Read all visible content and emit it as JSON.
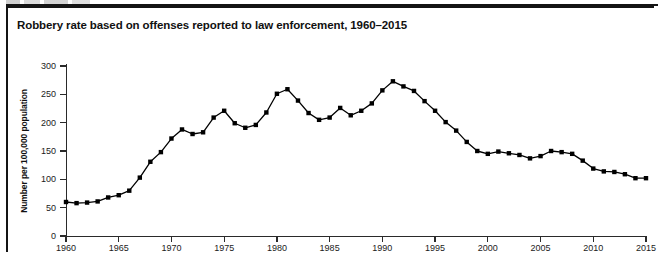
{
  "figure": {
    "title": "Robbery rate based on offenses reported to law enforcement, 1960–2015",
    "frame_color": "#141414",
    "background": "#ffffff"
  },
  "chart_data": {
    "type": "line",
    "title": "Robbery rate based on offenses reported to law enforcement, 1960–2015",
    "xlabel": "",
    "ylabel": "Number per 100,000 population",
    "xlim": [
      1960,
      2015
    ],
    "ylim": [
      0,
      300
    ],
    "ytick_labels": [
      "0",
      "50",
      "100",
      "150",
      "200",
      "250",
      "300"
    ],
    "yticks": [
      0,
      50,
      100,
      150,
      200,
      250,
      300
    ],
    "xtick_labels": [
      "1960",
      "1965",
      "1970",
      "1975",
      "1980",
      "1985",
      "1990",
      "1995",
      "2000",
      "2005",
      "2010",
      "2015"
    ],
    "xticks": [
      1960,
      1965,
      1970,
      1975,
      1980,
      1985,
      1990,
      1995,
      2000,
      2005,
      2010,
      2015
    ],
    "grid": false,
    "legend": "none",
    "series": [
      {
        "name": "Robbery rate",
        "color": "#000000",
        "marker": "square",
        "x": [
          1960,
          1961,
          1962,
          1963,
          1964,
          1965,
          1966,
          1967,
          1968,
          1969,
          1970,
          1971,
          1972,
          1973,
          1974,
          1975,
          1976,
          1977,
          1978,
          1979,
          1980,
          1981,
          1982,
          1983,
          1984,
          1985,
          1986,
          1987,
          1988,
          1989,
          1990,
          1991,
          1992,
          1993,
          1994,
          1995,
          1996,
          1997,
          1998,
          1999,
          2000,
          2001,
          2002,
          2003,
          2004,
          2005,
          2006,
          2007,
          2008,
          2009,
          2010,
          2011,
          2012,
          2013,
          2014,
          2015
        ],
        "values": [
          60,
          58,
          59,
          61,
          68,
          72,
          80,
          103,
          131,
          148,
          172,
          188,
          180,
          183,
          209,
          221,
          199,
          191,
          196,
          218,
          251,
          259,
          239,
          217,
          205,
          209,
          226,
          213,
          221,
          234,
          257,
          273,
          264,
          256,
          238,
          221,
          201,
          186,
          166,
          150,
          145,
          149,
          146,
          143,
          137,
          141,
          150,
          148,
          145,
          133,
          119,
          114,
          113,
          109,
          102,
          102
        ]
      }
    ]
  }
}
